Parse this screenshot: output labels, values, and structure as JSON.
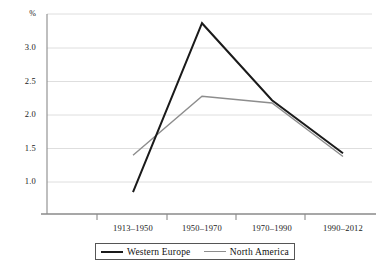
{
  "chart_data": {
    "type": "line",
    "title": "",
    "subtitle": "",
    "xlabel": "",
    "ylabel": "%",
    "categories": [
      "1913–1950",
      "1950–1970",
      "1970–1990",
      "1990–2012"
    ],
    "yticks": [
      "1.0",
      "1.5",
      "2.0",
      "2.5",
      "3.0"
    ],
    "ytick_values": [
      1.0,
      1.5,
      2.0,
      2.5,
      3.0
    ],
    "ylim": [
      0.6,
      3.5
    ],
    "grid": "horizontal",
    "legend_position": "bottom-center",
    "series": [
      {
        "name": "Western Europe",
        "color": "#1a1a1a",
        "width": 2.0,
        "values": [
          0.85,
          3.37,
          2.22,
          1.43
        ]
      },
      {
        "name": "North America",
        "color": "#8d8d8d",
        "width": 1.4,
        "values": [
          1.4,
          2.28,
          2.18,
          1.38
        ]
      }
    ]
  },
  "axis": {
    "unit_label": "%",
    "axis_color": "#8a8a8a",
    "grid_color": "#dedede"
  },
  "legend": {
    "items": [
      {
        "label": "Western Europe",
        "color": "#1a1a1a"
      },
      {
        "label": "North America",
        "color": "#8d8d8d"
      }
    ]
  }
}
